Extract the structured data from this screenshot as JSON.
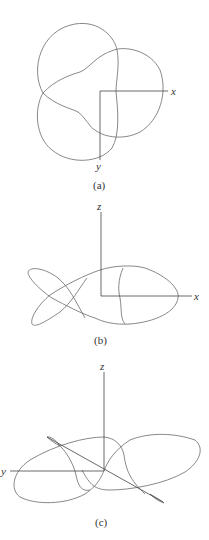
{
  "figures": [
    {
      "id": "a",
      "caption": "(a)",
      "axis_labels": {
        "x": "x",
        "y": "y"
      },
      "description": "Trefoil-like closed curve (three overlapping loops) in the xy-plane"
    },
    {
      "id": "b",
      "caption": "(b)",
      "axis_labels": {
        "z": "z",
        "x": "x"
      },
      "description": "Fish-shaped projection of the curve onto the xz-plane"
    },
    {
      "id": "c",
      "caption": "(c)",
      "axis_labels": {
        "z": "z",
        "y": "y"
      },
      "description": "Oblique 3D view of the space curve with y, z axes and a diagonal x axis"
    }
  ],
  "colors": {
    "curve": "#6a6a6a",
    "axis": "#444444",
    "text": "#333333"
  }
}
